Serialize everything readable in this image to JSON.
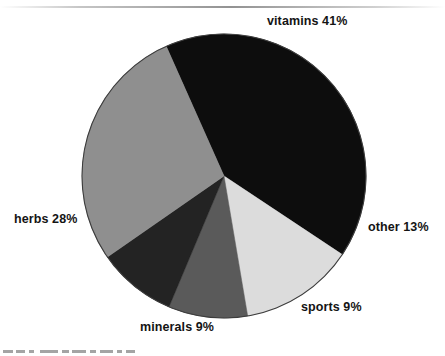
{
  "chart_data": {
    "type": "pie",
    "title": "",
    "subtitle": "",
    "xlabel": "",
    "ylabel": "",
    "legend_position": "none",
    "labels_position": "outside",
    "grid": false,
    "units": "percent",
    "total": 100,
    "start_angle_deg": -24,
    "direction": "clockwise",
    "categories": [
      "vitamins",
      "other",
      "sports",
      "minerals",
      "herbs"
    ],
    "values": [
      41,
      13,
      9,
      9,
      28
    ],
    "colors": [
      "#0d0d0d",
      "#dcdcdc",
      "#5a5a5a",
      "#232323",
      "#8f8f8f"
    ],
    "slices": [
      {
        "name": "vitamins",
        "value": 41,
        "label": "vitamins 41%",
        "value_text": "41%",
        "color": "#0d0d0d",
        "start_angle_deg": -24,
        "end_angle_deg": 123.6
      },
      {
        "name": "other",
        "value": 13,
        "label": "other 13%",
        "value_text": "13%",
        "color": "#dcdcdc",
        "start_angle_deg": 123.6,
        "end_angle_deg": 170.4
      },
      {
        "name": "sports",
        "value": 9,
        "label": "sports 9%",
        "value_text": "9%",
        "color": "#5a5a5a",
        "start_angle_deg": 170.4,
        "end_angle_deg": 202.8
      },
      {
        "name": "minerals",
        "value": 9,
        "label": "minerals 9%",
        "value_text": "9%",
        "color": "#232323",
        "start_angle_deg": 202.8,
        "end_angle_deg": 235.2
      },
      {
        "name": "herbs",
        "value": 28,
        "label": "herbs 28%",
        "value_text": "28%",
        "color": "#8f8f8f",
        "start_angle_deg": 235.2,
        "end_angle_deg": 336
      }
    ]
  },
  "chart": {
    "center_x": 224,
    "center_y": 176,
    "radius": 142,
    "background": "#ffffff",
    "outline_color": "#3c3c3c"
  },
  "labels": {
    "vitamins": "vitamins 41%",
    "other": "other 13%",
    "sports": "sports 9%",
    "minerals": "minerals 9%",
    "herbs": "herbs 28%"
  }
}
